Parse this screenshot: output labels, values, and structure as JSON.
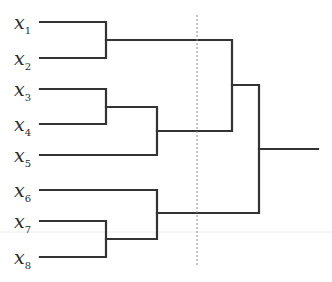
{
  "diagram": {
    "type": "dendrogram",
    "colors": {
      "branch": "#333333",
      "cut_line": "#8a8a8a",
      "label": "#2a2a2a"
    },
    "leaves": [
      {
        "id": "x1",
        "base": "x",
        "sub": "1",
        "y": 22
      },
      {
        "id": "x2",
        "base": "x",
        "sub": "2",
        "y": 58
      },
      {
        "id": "x3",
        "base": "x",
        "sub": "3",
        "y": 89
      },
      {
        "id": "x4",
        "base": "x",
        "sub": "4",
        "y": 124
      },
      {
        "id": "x5",
        "base": "x",
        "sub": "5",
        "y": 155
      },
      {
        "id": "x6",
        "base": "x",
        "sub": "6",
        "y": 190
      },
      {
        "id": "x7",
        "base": "x",
        "sub": "7",
        "y": 221
      },
      {
        "id": "x8",
        "base": "x",
        "sub": "8",
        "y": 257
      }
    ],
    "merges": [
      {
        "members": [
          "x1",
          "x2"
        ],
        "height_x": 106
      },
      {
        "members": [
          "x3",
          "x4"
        ],
        "height_x": 106
      },
      {
        "members": [
          "x7",
          "x8"
        ],
        "height_x": 106
      },
      {
        "members": [
          "(x3,x4)",
          "x5"
        ],
        "height_x": 157
      },
      {
        "members": [
          "x6",
          "(x7,x8)"
        ],
        "height_x": 157
      },
      {
        "members": [
          "(x1,x2)",
          "((x3,x4),x5)"
        ],
        "height_x": 232
      },
      {
        "members": [
          "(x1..x5)",
          "(x6..x8)"
        ],
        "height_x": 259
      }
    ],
    "cut_line": {
      "style": "dashed",
      "x": 197,
      "y_start": 15,
      "y_end": 267,
      "resulting_clusters": 4
    }
  }
}
